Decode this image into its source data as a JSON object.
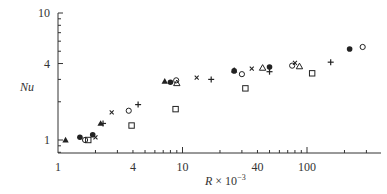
{
  "chart_data": {
    "type": "scatter",
    "title": "",
    "xlabel": "R × 10⁻³",
    "xlabel_parts": {
      "var": "R",
      "rest": " × 10",
      "exp": "−3"
    },
    "ylabel": "Nu",
    "xscale": "log",
    "yscale": "log",
    "xlim": [
      1,
      300
    ],
    "ylim": [
      0.79,
      10
    ],
    "x_ticks": [
      1,
      4,
      10,
      40,
      100
    ],
    "x_tick_labels": [
      "1",
      "4",
      "10",
      "40",
      "100"
    ],
    "y_ticks": [
      1,
      4,
      10
    ],
    "y_tick_labels": [
      "1",
      "4",
      "10"
    ],
    "grid": false,
    "legend": null,
    "series": [
      {
        "name": "triangle-filled",
        "marker": "▲",
        "points": [
          [
            1.15,
            1.0
          ],
          [
            2.2,
            1.35
          ],
          [
            7.2,
            2.9
          ],
          [
            26,
            3.55
          ]
        ]
      },
      {
        "name": "circle-filled",
        "marker": "●",
        "points": [
          [
            1.5,
            1.05
          ],
          [
            1.9,
            1.1
          ],
          [
            8.0,
            2.85
          ],
          [
            26,
            3.5
          ],
          [
            50,
            3.75
          ],
          [
            220,
            5.2
          ]
        ]
      },
      {
        "name": "circle-open",
        "marker": "○",
        "points": [
          [
            1.65,
            1.0
          ],
          [
            3.7,
            1.7
          ],
          [
            8.9,
            2.95
          ],
          [
            30,
            3.3
          ],
          [
            76,
            3.85
          ],
          [
            280,
            5.4
          ]
        ]
      },
      {
        "name": "square-open",
        "marker": "□",
        "points": [
          [
            1.75,
            1.0
          ],
          [
            3.9,
            1.3
          ],
          [
            8.8,
            1.75
          ],
          [
            32,
            2.55
          ],
          [
            110,
            3.35
          ]
        ]
      },
      {
        "name": "cross-x",
        "marker": "×",
        "points": [
          [
            2.0,
            1.05
          ],
          [
            2.7,
            1.65
          ],
          [
            13,
            3.1
          ],
          [
            36,
            3.65
          ],
          [
            80,
            4.05
          ]
        ]
      },
      {
        "name": "plus",
        "marker": "+",
        "points": [
          [
            2.3,
            1.35
          ],
          [
            4.4,
            1.9
          ],
          [
            17,
            3.0
          ],
          [
            50,
            3.45
          ],
          [
            155,
            4.1
          ]
        ]
      },
      {
        "name": "triangle-open",
        "marker": "△",
        "points": [
          [
            9.0,
            2.8
          ],
          [
            44,
            3.7
          ],
          [
            87,
            3.8
          ]
        ]
      }
    ]
  }
}
